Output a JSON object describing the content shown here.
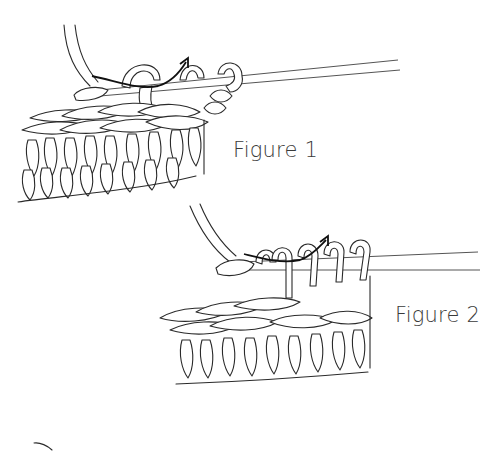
{
  "figures": [
    {
      "id": "figure-1",
      "label": "Figure 1",
      "content": "Tunisian crochet: hook inserted through vertical bar, yarn over and pull up loop (arrow)"
    },
    {
      "id": "figure-2",
      "label": "Figure 2",
      "content": "Tunisian crochet: multiple loops on hook, yarn over and pull through (arrow)"
    }
  ],
  "colors": {
    "ink": "#2a2a2a",
    "background": "#ffffff",
    "label": "#3a3a3a"
  }
}
